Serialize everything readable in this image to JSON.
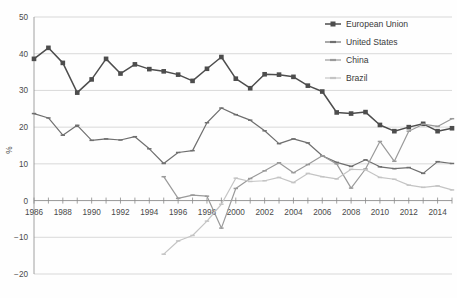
{
  "chart_data": {
    "type": "line",
    "title": "",
    "xlabel": "",
    "ylabel": "%",
    "xlim": [
      1986,
      2015
    ],
    "ylim": [
      -20,
      50
    ],
    "grid": true,
    "legend_position": "top-right",
    "y_ticks": [
      "50",
      "40",
      "30",
      "20",
      "10",
      "0",
      "−10",
      "−20"
    ],
    "y_tick_values": [
      50,
      40,
      30,
      20,
      10,
      0,
      -10,
      -20
    ],
    "x_ticks": [
      "1986",
      "1988",
      "1990",
      "1992",
      "1994",
      "1996",
      "1998",
      "2000",
      "2002",
      "2004",
      "2006",
      "2008",
      "2010",
      "2012",
      "2014"
    ],
    "x_tick_values": [
      1986,
      1988,
      1990,
      1992,
      1994,
      1996,
      1998,
      2000,
      2002,
      2004,
      2006,
      2008,
      2010,
      2012,
      2014
    ],
    "x": [
      1986,
      1987,
      1988,
      1989,
      1990,
      1991,
      1992,
      1993,
      1994,
      1995,
      1996,
      1997,
      1998,
      1999,
      2000,
      2001,
      2002,
      2003,
      2004,
      2005,
      2006,
      2007,
      2008,
      2009,
      2010,
      2011,
      2012,
      2013,
      2014,
      2015
    ],
    "series": [
      {
        "name": "European Union",
        "color": "#4d4d4d",
        "marker": "square",
        "x": [
          1986,
          1987,
          1988,
          1989,
          1990,
          1991,
          1992,
          1993,
          1994,
          1995,
          1996,
          1997,
          1998,
          1999,
          2000,
          2001,
          2002,
          2003,
          2004,
          2005,
          2006,
          2007,
          2008,
          2009,
          2010,
          2011,
          2012,
          2013,
          2014,
          2015
        ],
        "values": [
          38.6,
          41.6,
          37.5,
          29.4,
          33.0,
          38.6,
          34.6,
          37.1,
          35.8,
          35.2,
          34.3,
          32.6,
          35.9,
          39.1,
          33.2,
          30.6,
          34.4,
          34.3,
          33.7,
          31.3,
          29.7,
          24.0,
          23.7,
          24.1,
          20.6,
          18.9,
          20.0,
          20.9,
          18.9,
          19.7
        ]
      },
      {
        "name": "United States",
        "color": "#6f6f6f",
        "marker": "small-dash",
        "x": [
          1986,
          1987,
          1988,
          1989,
          1990,
          1991,
          1992,
          1993,
          1994,
          1995,
          1996,
          1997,
          1998,
          1999,
          2000,
          2001,
          2002,
          2003,
          2004,
          2005,
          2006,
          2007,
          2008,
          2009,
          2010,
          2011,
          2012,
          2013,
          2014,
          2015
        ],
        "values": [
          23.7,
          22.5,
          17.8,
          20.5,
          16.4,
          16.8,
          16.5,
          17.4,
          14.1,
          10.1,
          13.1,
          13.6,
          21.2,
          25.2,
          23.4,
          21.9,
          19.0,
          15.5,
          16.8,
          15.7,
          12.2,
          10.4,
          9.3,
          11.1,
          9.2,
          8.7,
          9.0,
          7.4,
          10.6,
          10.1
        ]
      },
      {
        "name": "China",
        "color": "#9a9a9a",
        "marker": "small-dash",
        "x": [
          1995,
          1996,
          1997,
          1998,
          1999,
          2000,
          2001,
          2002,
          2003,
          2004,
          2005,
          2006,
          2007,
          2008,
          2009,
          2010,
          2011,
          2012,
          2013,
          2014,
          2015
        ],
        "values": [
          6.5,
          0.6,
          1.5,
          1.2,
          -7.5,
          3.3,
          6.0,
          8.1,
          10.3,
          7.6,
          9.8,
          12.2,
          10.0,
          3.4,
          8.6,
          16.1,
          10.7,
          18.9,
          20.8,
          20.2,
          22.3
        ]
      },
      {
        "name": "Brazil",
        "color": "#c4c4c4",
        "marker": "small-dash",
        "x": [
          1995,
          1996,
          1997,
          1998,
          1999,
          2000,
          2001,
          2002,
          2003,
          2004,
          2005,
          2006,
          2007,
          2008,
          2009,
          2010,
          2011,
          2012,
          2013,
          2014,
          2015
        ],
        "values": [
          -14.6,
          -11.0,
          -9.5,
          -5.6,
          -1.0,
          6.1,
          5.2,
          5.4,
          6.3,
          4.9,
          7.4,
          6.5,
          5.9,
          8.5,
          8.4,
          6.3,
          5.8,
          4.2,
          3.6,
          4.0,
          2.9
        ]
      }
    ]
  },
  "legend": {
    "items": [
      {
        "label": "European Union"
      },
      {
        "label": "United States"
      },
      {
        "label": "China"
      },
      {
        "label": "Brazil"
      }
    ]
  }
}
